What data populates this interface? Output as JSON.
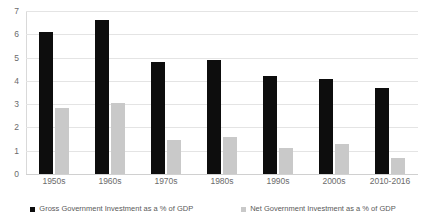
{
  "chart_data": {
    "type": "bar",
    "title": "",
    "subtitle": "",
    "xlabel": "",
    "ylabel": "",
    "ylim": [
      0,
      7
    ],
    "yticks": [
      0,
      1,
      2,
      3,
      4,
      5,
      6,
      7
    ],
    "ytick_labels": [
      "0",
      "1",
      "2",
      "3",
      "4",
      "5",
      "6",
      "7"
    ],
    "grid": true,
    "legend_position": "bottom",
    "categories": [
      "1950s",
      "1960s",
      "1970s",
      "1980s",
      "1990s",
      "2000s",
      "2010-2016"
    ],
    "series": [
      {
        "name": "Gross Government Investment as a % of GDP",
        "color": "#0d0d0d",
        "values": [
          6.1,
          6.6,
          4.8,
          4.9,
          4.2,
          4.1,
          3.7
        ]
      },
      {
        "name": "Net Government Investment as a % of GDP",
        "color": "#c9c9c9",
        "values": [
          2.85,
          3.05,
          1.45,
          1.6,
          1.1,
          1.3,
          0.7
        ]
      }
    ]
  },
  "legend": {
    "items": [
      {
        "label": "Gross Government Investment as a % of GDP",
        "marker": "square-marker-black"
      },
      {
        "label": "Net Government Investment as a % of GDP",
        "marker": "square-marker-gray"
      }
    ]
  }
}
